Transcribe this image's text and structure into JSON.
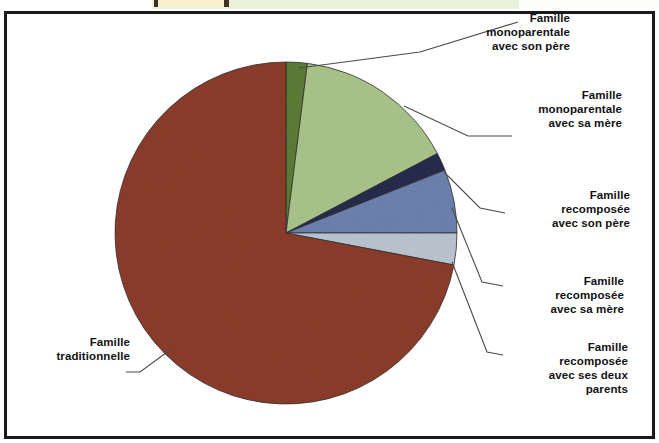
{
  "figure": {
    "background": "#ffffff",
    "border_color": "#1a1a1a"
  },
  "chart_data": {
    "type": "pie",
    "title": "",
    "subtitle": "",
    "xlabel": "",
    "ylabel": "",
    "legend_position": "callout-labels",
    "grid": false,
    "start_angle_deg": 0,
    "direction": "clockwise",
    "categories": [
      "Famille monoparentale avec son père",
      "Famille monoparentale avec sa mère",
      "Famille recomposée avec son père",
      "Famille recomposée avec sa mère",
      "Famille recomposée avec ses deux parents",
      "Famille traditionnelle"
    ],
    "values": [
      2,
      15.3,
      1.7,
      6,
      3,
      72
    ],
    "colors": [
      "#5c7c37",
      "#a9c48a",
      "#252b4c",
      "#6c81ae",
      "#bac5cf",
      "#8c3c2b"
    ],
    "slices": [
      {
        "label": "Famille monoparentale avec son père",
        "value": 2,
        "color": "#5c7c37",
        "start_deg": 0,
        "end_deg": 7.2
      },
      {
        "label": "Famille monoparentale avec sa mère",
        "value": 15.3,
        "color": "#a9c48a",
        "start_deg": 7.2,
        "end_deg": 62.3
      },
      {
        "label": "Famille recomposée avec son père",
        "value": 1.7,
        "color": "#252b4c",
        "start_deg": 62.3,
        "end_deg": 68.4
      },
      {
        "label": "Famille recomposée avec sa mère",
        "value": 6,
        "color": "#6c81ae",
        "start_deg": 68.4,
        "end_deg": 90
      },
      {
        "label": "Famille recomposée avec ses deux parents",
        "value": 3,
        "color": "#bac5cf",
        "start_deg": 90,
        "end_deg": 100.8
      },
      {
        "label": "Famille traditionnelle",
        "value": 72,
        "color": "#8c3c2b",
        "start_deg": 100.8,
        "end_deg": 360
      }
    ]
  },
  "callouts": {
    "mono_pere": "Famille\nmonoparentale\navec son père",
    "mono_mere": "Famille\nmonoparentale\navec sa mère",
    "recomp_pere": "Famille\nrecomposée\navec son père",
    "recomp_mere": "Famille\nrecomposée\navec sa mère",
    "recomp_deux": "Famille\nrecomposée\navec ses deux\nparents",
    "traditionnelle": "Famille\ntraditionnelle"
  }
}
